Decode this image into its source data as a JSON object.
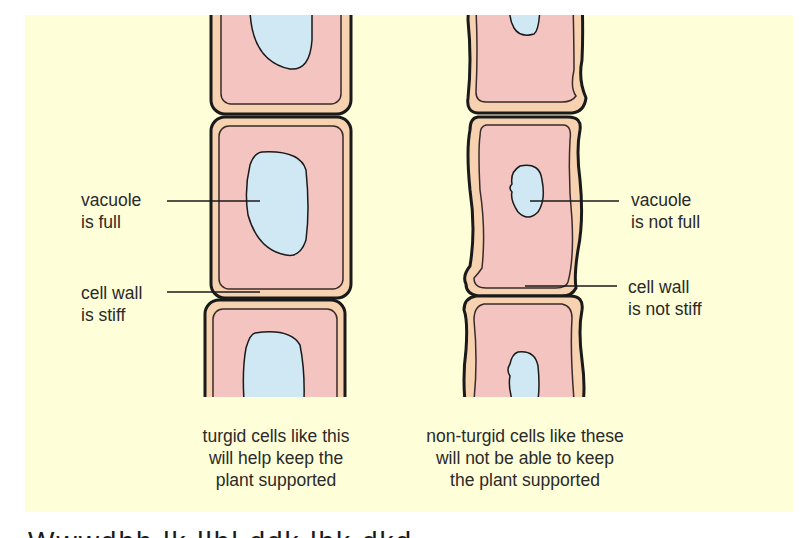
{
  "colors": {
    "panel_background": "#fefed8",
    "cell_wall": "#f7d2b0",
    "cytoplasm": "#f4c4c0",
    "vacuole": "#cfe8f3",
    "outline": "#1a1a1a",
    "text": "#2a2a2a"
  },
  "left_column": {
    "labels": {
      "vacuole": "vacuole\nis full",
      "cell_wall": "cell wall\nis stiff"
    },
    "caption": "turgid cells like this\nwill help keep the\nplant supported"
  },
  "right_column": {
    "labels": {
      "vacuole": "vacuole\nis not full",
      "cell_wall": "cell wall\nis not stiff"
    },
    "caption": "non-turgid cells like these\nwill not be able to keep\nthe plant supported"
  }
}
